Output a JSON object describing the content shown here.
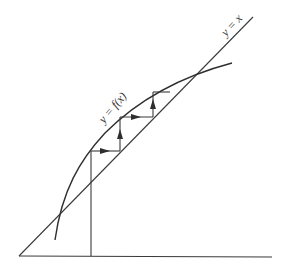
{
  "diagram": {
    "type": "cobweb-fixed-point-iteration",
    "labels": {
      "curve": "y = f(x)",
      "diagonal": "y = x"
    },
    "colors": {
      "line": "#3a3a3a",
      "background": "#ffffff"
    }
  }
}
